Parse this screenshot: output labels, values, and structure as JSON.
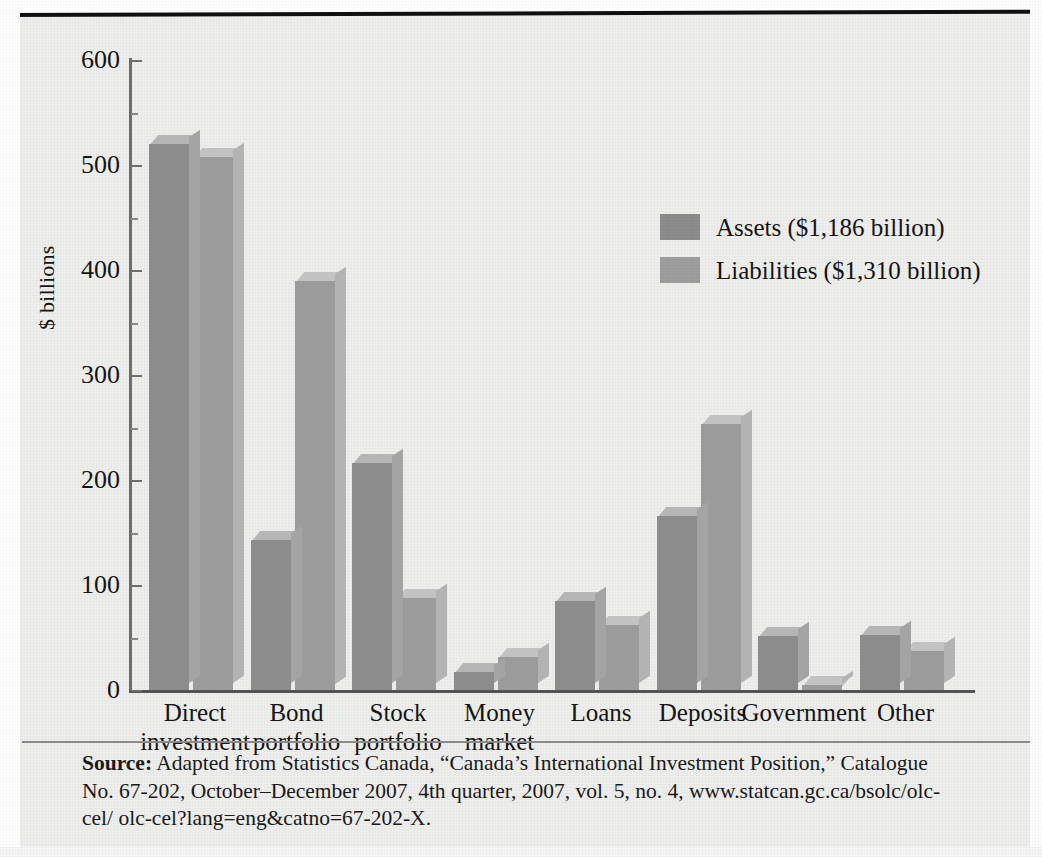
{
  "figure": {
    "y_axis_title": "$ billions",
    "source_label": "Source:",
    "source_line1": " Adapted from Statistics Canada, “Canada’s International Investment Position,” Catalogue",
    "source_line2": "No. 67-202, October–December 2007, 4th quarter, 2007, vol. 5, no. 4, www.statcan.gc.ca/bsolc/olc-cel/",
    "source_line3": "olc-cel?lang=eng&catno=67-202-X.",
    "assets_color": "#8c8c8c",
    "liabilities_color": "#9b9b9b",
    "background_color": "#eeeeed"
  },
  "chart_data": {
    "type": "bar",
    "title": "",
    "xlabel": "",
    "ylabel": "$ billions",
    "ylim": [
      0,
      600
    ],
    "yticks": [
      0,
      100,
      200,
      300,
      400,
      500,
      600
    ],
    "ytick_labels": [
      "0",
      "100",
      "200",
      "300",
      "400",
      "500",
      "600"
    ],
    "minor_ticks_interval": 50,
    "grid": false,
    "legend_position": "inside-upper-right",
    "categories": [
      "Direct investment",
      "Bond portfolio",
      "Stock portfolio",
      "Money market",
      "Loans",
      "Deposits",
      "Government",
      "Other"
    ],
    "series": [
      {
        "name": "Assets ($1,186 billion)",
        "color": "#8c8c8c",
        "values": [
          520,
          143,
          216,
          17,
          85,
          166,
          51,
          52
        ]
      },
      {
        "name": "Liabilities ($1,310 billion)",
        "color": "#9b9b9b",
        "values": [
          508,
          390,
          88,
          31,
          62,
          253,
          5,
          37
        ]
      }
    ]
  }
}
